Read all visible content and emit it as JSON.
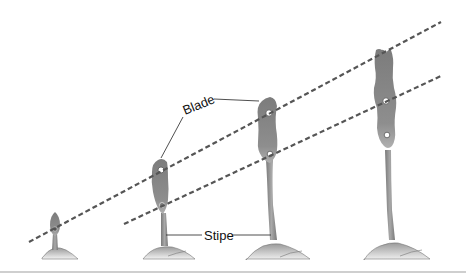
{
  "diagram": {
    "labels": {
      "blade": "Blade",
      "stipe": "Stipe"
    },
    "stages": [
      {
        "id": 1,
        "name": "stage-1-juvenile"
      },
      {
        "id": 2,
        "name": "stage-2"
      },
      {
        "id": 3,
        "name": "stage-3"
      },
      {
        "id": 4,
        "name": "stage-4-mature"
      }
    ],
    "reference_lines": [
      {
        "name": "upper-growth-line",
        "style": "dashed",
        "from": [
          29,
          242
        ],
        "to": [
          441,
          22
        ]
      },
      {
        "name": "lower-growth-line",
        "style": "dashed",
        "from": [
          124,
          224
        ],
        "to": [
          441,
          76
        ]
      }
    ],
    "colors": {
      "thallus": "#8a8a8a",
      "thallus_dark": "#6f6f6f",
      "holdfast_light": "#e6e6e6",
      "dashed_line": "#555555",
      "leader_line": "#222222",
      "text": "#111111"
    }
  }
}
